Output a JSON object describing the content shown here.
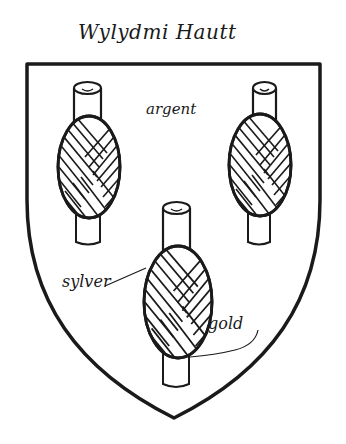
{
  "title": "Wylydmi Hautt",
  "shield": {
    "field_tincture_label": "argent",
    "stroke_color": "#1a1a1a",
    "fill_color": "#ffffff"
  },
  "charges": {
    "count": 3,
    "description": "three spools of thread (skeins wound on sticks)",
    "skein_tincture_label": "sylver",
    "stick_tincture_label": "gold"
  },
  "labels": {
    "field": "argent",
    "skein": "sylver",
    "stick": "gold"
  }
}
